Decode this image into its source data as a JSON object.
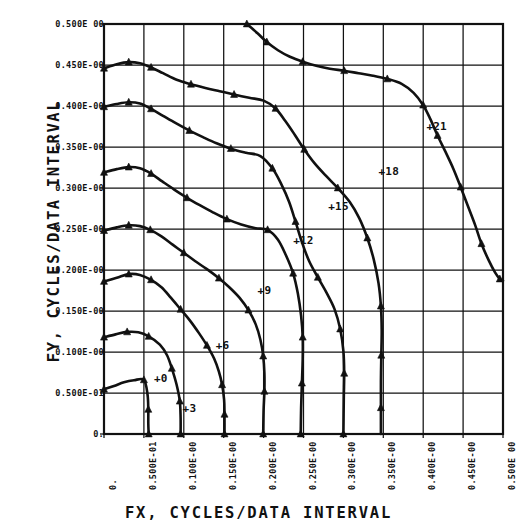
{
  "figure": {
    "x_title": "FX, CYCLES/DATA INTERVAL",
    "y_title": "FY, CYCLES/DATA INTERVAL",
    "ink_color": "#111111",
    "background_color": "#ffffff"
  },
  "chart_data": {
    "type": "line",
    "title": "",
    "xlabel": "FX, CYCLES/DATA INTERVAL",
    "ylabel": "FY, CYCLES/DATA INTERVAL",
    "xlim": [
      0,
      0.5
    ],
    "ylim": [
      0,
      0.5
    ],
    "grid": true,
    "legend": "inline-annotations",
    "x_tick_values": [
      0,
      0.05,
      0.1,
      0.15,
      0.2,
      0.25,
      0.3,
      0.35,
      0.4,
      0.45,
      0.5
    ],
    "y_tick_values": [
      0,
      0.05,
      0.1,
      0.15,
      0.2,
      0.25,
      0.3,
      0.35,
      0.4,
      0.45,
      0.5
    ],
    "x_tick_labels": [
      "0.",
      "0.500E-01",
      "0.100E-00",
      "0.150E-00",
      "0.200E-00",
      "0.250E-00",
      "0.300E-00",
      "0.350E-00",
      "0.400E-00",
      "0.450E-00",
      "0.500E 00"
    ],
    "y_tick_labels": [
      "0.",
      "0.500E-01",
      "0.100E-00",
      "0.150E-00",
      "0.200E-00",
      "0.250E-00",
      "0.300E-00",
      "0.350E-00",
      "0.400E-00",
      "0.450E-00",
      "0.500E 00"
    ],
    "series": [
      {
        "name": "+0",
        "label": "+0",
        "label_xy": [
          0.0625,
          0.0665
        ],
        "points": [
          [
            0.0,
            0.0545
          ],
          [
            0.0125,
            0.0585
          ],
          [
            0.025,
            0.063
          ],
          [
            0.0375,
            0.0655
          ],
          [
            0.05,
            0.066
          ],
          [
            0.0545,
            0.0485
          ],
          [
            0.0555,
            0.03
          ],
          [
            0.0555,
            0.013
          ],
          [
            0.056,
            0.0
          ]
        ]
      },
      {
        "name": "+3",
        "label": "+3",
        "label_xy": [
          0.0985,
          0.03
        ],
        "points": [
          [
            0.0,
            0.118
          ],
          [
            0.0145,
            0.1215
          ],
          [
            0.029,
            0.1245
          ],
          [
            0.043,
            0.124
          ],
          [
            0.056,
            0.119
          ],
          [
            0.07,
            0.109
          ],
          [
            0.079,
            0.096
          ],
          [
            0.085,
            0.08
          ],
          [
            0.091,
            0.06
          ],
          [
            0.095,
            0.04
          ],
          [
            0.096,
            0.02
          ],
          [
            0.096,
            0.0
          ]
        ]
      },
      {
        "name": "+6",
        "label": "+6",
        "label_xy": [
          0.14,
          0.107
        ],
        "points": [
          [
            0.0,
            0.186
          ],
          [
            0.016,
            0.1905
          ],
          [
            0.031,
            0.195
          ],
          [
            0.045,
            0.194
          ],
          [
            0.059,
            0.188
          ],
          [
            0.072,
            0.179
          ],
          [
            0.084,
            0.166
          ],
          [
            0.096,
            0.152
          ],
          [
            0.108,
            0.138
          ],
          [
            0.119,
            0.123
          ],
          [
            0.129,
            0.108
          ],
          [
            0.138,
            0.092
          ],
          [
            0.144,
            0.076
          ],
          [
            0.148,
            0.06
          ],
          [
            0.1505,
            0.042
          ],
          [
            0.151,
            0.024
          ],
          [
            0.151,
            0.0
          ]
        ]
      },
      {
        "name": "+9",
        "label": "+9",
        "label_xy": [
          0.1925,
          0.1745
        ],
        "points": [
          [
            0.0,
            0.248
          ],
          [
            0.016,
            0.252
          ],
          [
            0.031,
            0.2545
          ],
          [
            0.045,
            0.2535
          ],
          [
            0.058,
            0.249
          ],
          [
            0.072,
            0.241
          ],
          [
            0.086,
            0.231
          ],
          [
            0.1,
            0.221
          ],
          [
            0.114,
            0.211
          ],
          [
            0.129,
            0.201
          ],
          [
            0.144,
            0.19
          ],
          [
            0.157,
            0.179
          ],
          [
            0.17,
            0.166
          ],
          [
            0.181,
            0.151
          ],
          [
            0.19,
            0.134
          ],
          [
            0.196,
            0.115
          ],
          [
            0.1995,
            0.095
          ],
          [
            0.201,
            0.074
          ],
          [
            0.201,
            0.052
          ],
          [
            0.2,
            0.029
          ],
          [
            0.1995,
            0.0
          ]
        ]
      },
      {
        "name": "+12",
        "label": "+12",
        "label_xy": [
          0.237,
          0.235
        ],
        "points": [
          [
            0.0,
            0.319
          ],
          [
            0.016,
            0.323
          ],
          [
            0.031,
            0.3255
          ],
          [
            0.045,
            0.324
          ],
          [
            0.059,
            0.3175
          ],
          [
            0.073,
            0.308
          ],
          [
            0.088,
            0.298
          ],
          [
            0.104,
            0.288
          ],
          [
            0.12,
            0.279
          ],
          [
            0.137,
            0.27
          ],
          [
            0.154,
            0.262
          ],
          [
            0.172,
            0.2555
          ],
          [
            0.19,
            0.251
          ],
          [
            0.205,
            0.249
          ],
          [
            0.218,
            0.237
          ],
          [
            0.228,
            0.218
          ],
          [
            0.237,
            0.196
          ],
          [
            0.243,
            0.171
          ],
          [
            0.247,
            0.144
          ],
          [
            0.249,
            0.118
          ],
          [
            0.249,
            0.091
          ],
          [
            0.248,
            0.062
          ],
          [
            0.247,
            0.032
          ],
          [
            0.2465,
            0.0
          ]
        ]
      },
      {
        "name": "+15",
        "label": "+15",
        "label_xy": [
          0.281,
          0.277
        ],
        "points": [
          [
            0.0,
            0.399
          ],
          [
            0.016,
            0.4025
          ],
          [
            0.031,
            0.4045
          ],
          [
            0.045,
            0.403
          ],
          [
            0.059,
            0.3965
          ],
          [
            0.074,
            0.388
          ],
          [
            0.09,
            0.379
          ],
          [
            0.107,
            0.37
          ],
          [
            0.124,
            0.362
          ],
          [
            0.141,
            0.3545
          ],
          [
            0.159,
            0.348
          ],
          [
            0.178,
            0.343
          ],
          [
            0.196,
            0.339
          ],
          [
            0.211,
            0.324
          ],
          [
            0.222,
            0.305
          ],
          [
            0.232,
            0.283
          ],
          [
            0.24,
            0.259
          ],
          [
            0.248,
            0.234
          ],
          [
            0.257,
            0.211
          ],
          [
            0.268,
            0.191
          ],
          [
            0.279,
            0.172
          ],
          [
            0.289,
            0.152
          ],
          [
            0.296,
            0.128
          ],
          [
            0.3,
            0.101
          ],
          [
            0.301,
            0.074
          ],
          [
            0.3005,
            0.044
          ],
          [
            0.3,
            0.0
          ]
        ]
      },
      {
        "name": "+18",
        "label": "+18",
        "label_xy": [
          0.344,
          0.32
        ],
        "points": [
          [
            0.0,
            0.446
          ],
          [
            0.016,
            0.451
          ],
          [
            0.031,
            0.4535
          ],
          [
            0.045,
            0.452
          ],
          [
            0.059,
            0.447
          ],
          [
            0.074,
            0.44
          ],
          [
            0.091,
            0.432
          ],
          [
            0.109,
            0.4265
          ],
          [
            0.127,
            0.422
          ],
          [
            0.145,
            0.418
          ],
          [
            0.163,
            0.414
          ],
          [
            0.182,
            0.41
          ],
          [
            0.2,
            0.4065
          ],
          [
            0.215,
            0.397
          ],
          [
            0.227,
            0.382
          ],
          [
            0.239,
            0.365
          ],
          [
            0.251,
            0.347
          ],
          [
            0.264,
            0.33
          ],
          [
            0.278,
            0.315
          ],
          [
            0.293,
            0.3
          ],
          [
            0.308,
            0.283
          ],
          [
            0.32,
            0.263
          ],
          [
            0.33,
            0.239
          ],
          [
            0.338,
            0.213
          ],
          [
            0.344,
            0.184
          ],
          [
            0.347,
            0.156
          ],
          [
            0.348,
            0.127
          ],
          [
            0.3475,
            0.096
          ],
          [
            0.347,
            0.064
          ],
          [
            0.347,
            0.032
          ],
          [
            0.347,
            0.0
          ]
        ]
      },
      {
        "name": "+21",
        "label": "+21",
        "label_xy": [
          0.404,
          0.374
        ],
        "points": [
          [
            0.179,
            0.5
          ],
          [
            0.192,
            0.489
          ],
          [
            0.204,
            0.478
          ],
          [
            0.218,
            0.468
          ],
          [
            0.233,
            0.46
          ],
          [
            0.249,
            0.454
          ],
          [
            0.266,
            0.449
          ],
          [
            0.283,
            0.4455
          ],
          [
            0.301,
            0.443
          ],
          [
            0.319,
            0.44
          ],
          [
            0.337,
            0.437
          ],
          [
            0.355,
            0.433
          ],
          [
            0.373,
            0.427
          ],
          [
            0.388,
            0.416
          ],
          [
            0.4,
            0.401
          ],
          [
            0.409,
            0.384
          ],
          [
            0.418,
            0.364
          ],
          [
            0.428,
            0.344
          ],
          [
            0.438,
            0.323
          ],
          [
            0.447,
            0.301
          ],
          [
            0.456,
            0.278
          ],
          [
            0.465,
            0.255
          ],
          [
            0.473,
            0.232
          ],
          [
            0.482,
            0.212
          ],
          [
            0.49,
            0.197
          ],
          [
            0.496,
            0.189
          ],
          [
            0.5,
            0.187
          ]
        ]
      }
    ],
    "markers": {
      "+0": [
        [
          0.0,
          0.0545
        ],
        [
          0.05,
          0.066
        ],
        [
          0.0555,
          0.03
        ],
        [
          0.056,
          0.0
        ]
      ],
      "+3": [
        [
          0.0,
          0.118
        ],
        [
          0.029,
          0.1245
        ],
        [
          0.056,
          0.119
        ],
        [
          0.085,
          0.08
        ],
        [
          0.095,
          0.04
        ],
        [
          0.096,
          0.0
        ]
      ],
      "+6": [
        [
          0.0,
          0.186
        ],
        [
          0.031,
          0.195
        ],
        [
          0.059,
          0.188
        ],
        [
          0.096,
          0.152
        ],
        [
          0.129,
          0.108
        ],
        [
          0.148,
          0.06
        ],
        [
          0.151,
          0.024
        ],
        [
          0.151,
          0.0
        ]
      ],
      "+9": [
        [
          0.0,
          0.248
        ],
        [
          0.031,
          0.2545
        ],
        [
          0.058,
          0.249
        ],
        [
          0.1,
          0.221
        ],
        [
          0.144,
          0.19
        ],
        [
          0.181,
          0.151
        ],
        [
          0.1995,
          0.095
        ],
        [
          0.201,
          0.052
        ],
        [
          0.1995,
          0.0
        ]
      ],
      "+12": [
        [
          0.0,
          0.319
        ],
        [
          0.031,
          0.3255
        ],
        [
          0.059,
          0.3175
        ],
        [
          0.104,
          0.288
        ],
        [
          0.154,
          0.262
        ],
        [
          0.205,
          0.249
        ],
        [
          0.237,
          0.196
        ],
        [
          0.249,
          0.118
        ],
        [
          0.248,
          0.062
        ],
        [
          0.2465,
          0.0
        ]
      ],
      "+15": [
        [
          0.0,
          0.399
        ],
        [
          0.031,
          0.4045
        ],
        [
          0.059,
          0.3965
        ],
        [
          0.107,
          0.37
        ],
        [
          0.159,
          0.348
        ],
        [
          0.211,
          0.324
        ],
        [
          0.24,
          0.259
        ],
        [
          0.268,
          0.191
        ],
        [
          0.296,
          0.128
        ],
        [
          0.301,
          0.074
        ],
        [
          0.3,
          0.0
        ]
      ],
      "+18": [
        [
          0.0,
          0.446
        ],
        [
          0.031,
          0.4535
        ],
        [
          0.059,
          0.447
        ],
        [
          0.109,
          0.4265
        ],
        [
          0.163,
          0.414
        ],
        [
          0.215,
          0.397
        ],
        [
          0.251,
          0.347
        ],
        [
          0.293,
          0.3
        ],
        [
          0.33,
          0.239
        ],
        [
          0.347,
          0.156
        ],
        [
          0.3475,
          0.096
        ],
        [
          0.347,
          0.032
        ]
      ],
      "+21": [
        [
          0.179,
          0.5
        ],
        [
          0.204,
          0.478
        ],
        [
          0.249,
          0.454
        ],
        [
          0.301,
          0.443
        ],
        [
          0.355,
          0.433
        ],
        [
          0.4,
          0.401
        ],
        [
          0.418,
          0.364
        ],
        [
          0.447,
          0.301
        ],
        [
          0.473,
          0.232
        ],
        [
          0.496,
          0.189
        ]
      ]
    }
  }
}
